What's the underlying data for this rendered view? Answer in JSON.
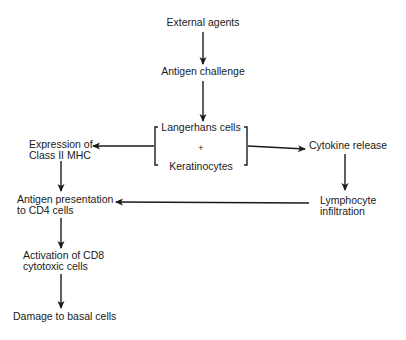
{
  "diagram": {
    "type": "flowchart",
    "nodes": {
      "external_agents": "External agents",
      "antigen_challenge": "Antigen challenge",
      "langerhans_cells": "Langerhans cells",
      "plus": "+",
      "keratinocytes": "Keratinocytes",
      "expression_l1": "Expression of",
      "expression_l2": "Class II MHC",
      "cytokine_release": "Cytokine release",
      "antigen_presentation_l1": "Antigen presentation",
      "antigen_presentation_l2": "to CD4 cells",
      "lymphocyte_l1": "Lymphocyte",
      "lymphocyte_l2": "infiltration",
      "activation_l1": "Activation of CD8",
      "activation_l2": "cytotoxic cells",
      "damage": "Damage to basal cells"
    },
    "edges": [
      {
        "from": "External agents",
        "to": "Antigen challenge"
      },
      {
        "from": "Antigen challenge",
        "to": "Langerhans cells + Keratinocytes"
      },
      {
        "from": "Langerhans cells + Keratinocytes",
        "to": "Expression of Class II MHC"
      },
      {
        "from": "Langerhans cells + Keratinocytes",
        "to": "Cytokine release"
      },
      {
        "from": "Expression of Class II MHC",
        "to": "Antigen presentation to CD4 cells"
      },
      {
        "from": "Cytokine release",
        "to": "Lymphocyte infiltration"
      },
      {
        "from": "Lymphocyte infiltration",
        "to": "Antigen presentation to CD4 cells"
      },
      {
        "from": "Antigen presentation to CD4 cells",
        "to": "Activation of CD8 cytotoxic cells"
      },
      {
        "from": "Activation of CD8 cytotoxic cells",
        "to": "Damage to basal cells"
      }
    ]
  }
}
